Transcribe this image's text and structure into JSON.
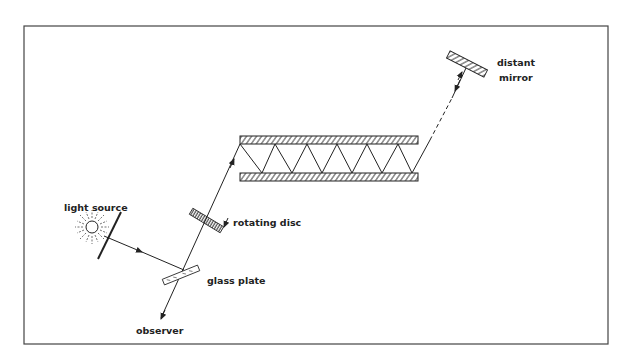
{
  "diagram": {
    "type": "optical-apparatus",
    "colors": {
      "background": "#ffffff",
      "frame": "#444444",
      "ink": "#222222"
    },
    "labels": {
      "light_source": "light source",
      "rotating_disc": "rotating disc",
      "glass_plate": "glass plate",
      "observer": "observer",
      "distant_mirror_line1": "distant",
      "distant_mirror_line2": "mirror"
    },
    "components": [
      {
        "id": "light-source",
        "label": "light source"
      },
      {
        "id": "glass-plate",
        "label": "glass plate"
      },
      {
        "id": "rotating-disc",
        "label": "rotating disc"
      },
      {
        "id": "parallel-mirrors",
        "label": ""
      },
      {
        "id": "distant-mirror",
        "label": "distant mirror"
      },
      {
        "id": "observer",
        "label": "observer"
      }
    ]
  }
}
